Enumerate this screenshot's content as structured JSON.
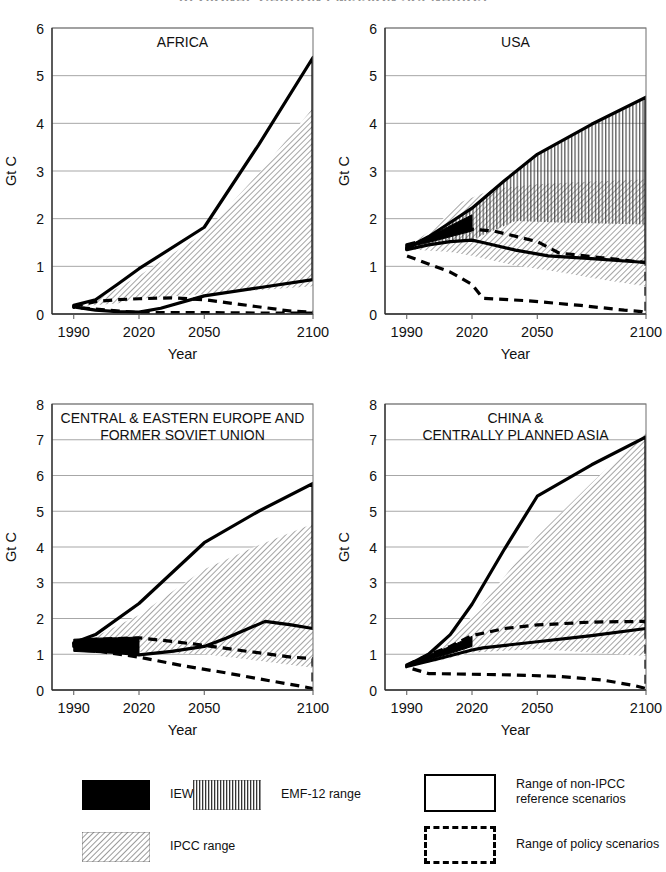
{
  "figure": {
    "title": "REGIONAL CARBON EMISSION SCENARIOS",
    "y_axis_label": "Gt C",
    "x_axis_label": "Year"
  },
  "legend": {
    "items": [
      {
        "key": "iew",
        "label": "IEW range",
        "style": "solid-black"
      },
      {
        "key": "emf12",
        "label": "EMF-12 range",
        "style": "vertical-hatch"
      },
      {
        "key": "ipcc",
        "label": "IPCC range",
        "style": "diagonal-hatch"
      },
      {
        "key": "non_ipcc",
        "label": "Range of non-IPCC\nreference scenarios",
        "style": "outline-solid"
      },
      {
        "key": "policy",
        "label": "Range of policy scenarios",
        "style": "outline-dashed"
      }
    ]
  },
  "chart_data": [
    {
      "id": "africa",
      "type": "area",
      "title": "AFRICA",
      "xlabel": "Year",
      "ylabel": "Gt C",
      "xlim": [
        1980,
        2100
      ],
      "ylim": [
        0,
        6
      ],
      "xticks": [
        1990,
        2020,
        2050,
        2100
      ],
      "yticks": [
        0,
        1,
        2,
        3,
        4,
        5,
        6
      ],
      "grid": true,
      "legend_position": "figure-bottom",
      "series": [
        {
          "name": "Range of non-IPCC reference scenarios",
          "style": "solid-outline",
          "upper": {
            "x": [
              1990,
              2000,
              2010,
              2020,
              2050,
              2075,
              2100
            ],
            "y": [
              0.18,
              0.3,
              0.62,
              0.95,
              1.82,
              3.55,
              5.38
            ]
          },
          "lower": {
            "x": [
              1990,
              2000,
              2010,
              2020,
              2030,
              2050,
              2075,
              2100
            ],
            "y": [
              0.15,
              0.08,
              0.05,
              0.04,
              0.12,
              0.38,
              0.55,
              0.72
            ]
          }
        },
        {
          "name": "Range of policy scenarios",
          "style": "dashed-outline",
          "upper": {
            "x": [
              1990,
              2000,
              2010,
              2020,
              2035,
              2050,
              2070,
              2090,
              2100
            ],
            "y": [
              0.16,
              0.26,
              0.3,
              0.32,
              0.34,
              0.3,
              0.18,
              0.06,
              0.04
            ]
          },
          "lower": {
            "x": [
              1990,
              2020,
              2050,
              2075,
              2100
            ],
            "y": [
              0.14,
              0.03,
              0.03,
              0.02,
              0.02
            ]
          }
        },
        {
          "name": "IPCC range",
          "style": "diagonal-hatch",
          "upper": {
            "x": [
              1990,
              2000,
              2020,
              2050,
              2075,
              2100
            ],
            "y": [
              0.16,
              0.28,
              0.8,
              1.7,
              2.95,
              4.32
            ]
          },
          "lower": {
            "x": [
              1990,
              2010,
              2020,
              2050,
              2075,
              2100
            ],
            "y": [
              0.15,
              0.22,
              0.32,
              0.42,
              0.5,
              0.58
            ]
          }
        }
      ]
    },
    {
      "id": "usa",
      "type": "area",
      "title": "USA",
      "xlabel": "Year",
      "ylabel": "Gt C",
      "xlim": [
        1980,
        2100
      ],
      "ylim": [
        0,
        6
      ],
      "xticks": [
        1990,
        2020,
        2050,
        2100
      ],
      "yticks": [
        0,
        1,
        2,
        3,
        4,
        5,
        6
      ],
      "grid": true,
      "legend_position": "figure-bottom",
      "series": [
        {
          "name": "Range of non-IPCC reference scenarios",
          "style": "solid-outline",
          "upper": {
            "x": [
              1990,
              2000,
              2010,
              2020,
              2035,
              2050,
              2075,
              2100
            ],
            "y": [
              1.38,
              1.62,
              1.92,
              2.22,
              2.8,
              3.35,
              3.98,
              4.55
            ]
          },
          "lower": {
            "x": [
              1990,
              2000,
              2010,
              2020,
              2025,
              2040,
              2055,
              2075,
              2100
            ],
            "y": [
              1.35,
              1.45,
              1.52,
              1.55,
              1.5,
              1.34,
              1.22,
              1.16,
              1.08
            ]
          }
        },
        {
          "name": "Range of policy scenarios",
          "style": "dashed-outline",
          "upper": {
            "x": [
              1990,
              2000,
              2010,
              2020,
              2030,
              2050,
              2060,
              2080,
              2100
            ],
            "y": [
              1.45,
              1.58,
              1.68,
              1.78,
              1.74,
              1.52,
              1.28,
              1.18,
              1.08
            ]
          },
          "lower": {
            "x": [
              1990,
              2000,
              2010,
              2020,
              2025,
              2045,
              2070,
              2090,
              2098,
              2100
            ],
            "y": [
              1.22,
              1.05,
              0.88,
              0.62,
              0.33,
              0.28,
              0.18,
              0.08,
              0.05,
              0.02
            ]
          }
        },
        {
          "name": "IPCC range",
          "style": "diagonal-hatch",
          "upper": {
            "x": [
              1990,
              2000,
              2015,
              2030,
              2050,
              2075,
              2100
            ],
            "y": [
              1.4,
              1.72,
              2.35,
              2.62,
              2.72,
              2.78,
              2.82
            ]
          },
          "lower": {
            "x": [
              1990,
              2010,
              2020,
              2040,
              2060,
              2080,
              2100
            ],
            "y": [
              1.36,
              1.3,
              1.22,
              1.02,
              0.88,
              0.72,
              0.58
            ]
          }
        },
        {
          "name": "EMF-12 range",
          "style": "vertical-hatch",
          "upper": {
            "x": [
              1990,
              2000,
              2010,
              2020,
              2035,
              2050,
              2075,
              2100
            ],
            "y": [
              1.38,
              1.62,
              1.92,
              2.22,
              2.78,
              3.32,
              3.95,
              4.52
            ]
          },
          "lower": {
            "x": [
              1990,
              2000,
              2010,
              2020,
              2040,
              2060,
              2080,
              2100
            ],
            "y": [
              1.36,
              1.46,
              1.52,
              1.56,
              1.95,
              1.92,
              1.9,
              1.88
            ]
          }
        },
        {
          "name": "IEW range",
          "style": "solid-black",
          "upper": {
            "x": [
              1990,
              2000,
              2010,
              2020
            ],
            "y": [
              1.42,
              1.62,
              1.85,
              2.08
            ]
          },
          "lower": {
            "x": [
              1990,
              2000,
              2010,
              2020
            ],
            "y": [
              1.4,
              1.5,
              1.62,
              1.74
            ]
          }
        }
      ]
    },
    {
      "id": "ceeu_fsu",
      "type": "area",
      "title": "CENTRAL & EASTERN EUROPE AND\nFORMER SOVIET UNION",
      "xlabel": "Year",
      "ylabel": "Gt C",
      "xlim": [
        1980,
        2100
      ],
      "ylim": [
        0,
        8
      ],
      "xticks": [
        1990,
        2020,
        2050,
        2100
      ],
      "yticks": [
        0,
        1,
        2,
        3,
        4,
        5,
        6,
        7,
        8
      ],
      "grid": true,
      "legend_position": "figure-bottom",
      "series": [
        {
          "name": "Range of non-IPCC reference scenarios",
          "style": "solid-outline",
          "upper": {
            "x": [
              1990,
              2000,
              2020,
              2050,
              2075,
              2100
            ],
            "y": [
              1.32,
              1.55,
              2.42,
              4.12,
              5.0,
              5.78
            ]
          },
          "lower": {
            "x": [
              1990,
              2010,
              2020,
              2035,
              2050,
              2060,
              2078,
              2090,
              2100
            ],
            "y": [
              1.3,
              1.05,
              0.98,
              1.08,
              1.22,
              1.45,
              1.92,
              1.82,
              1.72
            ]
          }
        },
        {
          "name": "Range of policy scenarios",
          "style": "dashed-outline",
          "upper": {
            "x": [
              1990,
              2000,
              2010,
              2020,
              2035,
              2050,
              2070,
              2090,
              2100
            ],
            "y": [
              1.3,
              1.42,
              1.44,
              1.46,
              1.36,
              1.25,
              1.08,
              0.92,
              0.88
            ]
          },
          "lower": {
            "x": [
              1990,
              2005,
              2020,
              2040,
              2060,
              2080,
              2095,
              2100
            ],
            "y": [
              1.22,
              1.05,
              0.92,
              0.68,
              0.48,
              0.26,
              0.1,
              0.04
            ]
          }
        },
        {
          "name": "IPCC range",
          "style": "diagonal-hatch",
          "upper": {
            "x": [
              1990,
              2000,
              2020,
              2050,
              2075,
              2100
            ],
            "y": [
              1.3,
              1.5,
              2.1,
              3.38,
              4.05,
              4.65
            ]
          },
          "lower": {
            "x": [
              1990,
              2010,
              2025,
              2050,
              2075,
              2100
            ],
            "y": [
              1.28,
              1.12,
              1.05,
              1.0,
              0.82,
              0.62
            ]
          }
        },
        {
          "name": "IEW range",
          "style": "solid-black",
          "upper": {
            "x": [
              1990,
              2000,
              2010,
              2020
            ],
            "y": [
              1.42,
              1.45,
              1.46,
              1.48
            ]
          },
          "lower": {
            "x": [
              1990,
              2000,
              2010,
              2020
            ],
            "y": [
              1.08,
              1.05,
              1.02,
              1.0
            ]
          }
        }
      ]
    },
    {
      "id": "china_cpa",
      "type": "area",
      "title": "CHINA &\nCENTRALLY PLANNED ASIA",
      "xlabel": "Year",
      "ylabel": "Gt C",
      "xlim": [
        1980,
        2100
      ],
      "ylim": [
        0,
        8
      ],
      "xticks": [
        1990,
        2020,
        2050,
        2100
      ],
      "yticks": [
        0,
        1,
        2,
        3,
        4,
        5,
        6,
        7,
        8
      ],
      "grid": true,
      "legend_position": "figure-bottom",
      "series": [
        {
          "name": "Range of non-IPCC reference scenarios",
          "style": "solid-outline",
          "upper": {
            "x": [
              1990,
              2000,
              2010,
              2020,
              2035,
              2050,
              2075,
              2100
            ],
            "y": [
              0.68,
              1.0,
              1.55,
              2.4,
              3.95,
              5.42,
              6.3,
              7.08
            ]
          },
          "lower": {
            "x": [
              1990,
              2005,
              2020,
              2025,
              2050,
              2075,
              2100
            ],
            "y": [
              0.66,
              0.88,
              1.12,
              1.18,
              1.35,
              1.52,
              1.72
            ]
          }
        },
        {
          "name": "Range of policy scenarios",
          "style": "dashed-outline",
          "upper": {
            "x": [
              1990,
              2000,
              2010,
              2020,
              2035,
              2050,
              2075,
              2100
            ],
            "y": [
              0.7,
              0.98,
              1.22,
              1.52,
              1.72,
              1.82,
              1.9,
              1.92
            ]
          },
          "lower": {
            "x": [
              1990,
              2000,
              2020,
              2040,
              2060,
              2080,
              2095,
              2100
            ],
            "y": [
              0.64,
              0.46,
              0.44,
              0.42,
              0.38,
              0.28,
              0.12,
              0.04
            ]
          }
        },
        {
          "name": "IPCC range",
          "style": "diagonal-hatch",
          "upper": {
            "x": [
              1990,
              2000,
              2020,
              2050,
              2075,
              2100
            ],
            "y": [
              0.68,
              1.05,
              2.05,
              4.3,
              5.8,
              7.2
            ]
          },
          "lower": {
            "x": [
              1990,
              2005,
              2020,
              2050,
              2075,
              2100
            ],
            "y": [
              0.66,
              0.82,
              1.05,
              1.15,
              1.05,
              0.95
            ]
          }
        },
        {
          "name": "IEW range",
          "style": "solid-black",
          "upper": {
            "x": [
              1990,
              2000,
              2010,
              2020
            ],
            "y": [
              0.72,
              0.98,
              1.22,
              1.5
            ]
          },
          "lower": {
            "x": [
              1990,
              2000,
              2010,
              2020
            ],
            "y": [
              0.66,
              0.84,
              1.02,
              1.22
            ]
          }
        }
      ]
    }
  ]
}
